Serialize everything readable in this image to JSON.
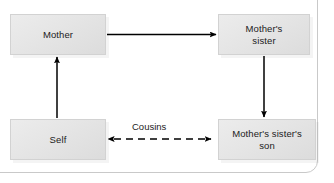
{
  "diagram": {
    "type": "kinship-relationship-diagram",
    "nodes": [
      {
        "id": "mother",
        "label": "Mother"
      },
      {
        "id": "mothers-sister",
        "label": "Mother's\nsister",
        "line1": "Mother's",
        "line2": "sister"
      },
      {
        "id": "self",
        "label": "Self"
      },
      {
        "id": "mothers-sisters-son",
        "label": "Mother's sister's\nson",
        "line1": "Mother's sister's",
        "line2": "son"
      }
    ],
    "edges": [
      {
        "id": "mother-to-sister",
        "from": "mother",
        "to": "mothers-sister",
        "style": "solid",
        "arrow": "single",
        "direction": "right",
        "label": ""
      },
      {
        "id": "sister-to-son",
        "from": "mothers-sister",
        "to": "mothers-sisters-son",
        "style": "solid",
        "arrow": "single",
        "direction": "down",
        "label": ""
      },
      {
        "id": "self-to-mother",
        "from": "self",
        "to": "mother",
        "style": "solid",
        "arrow": "single",
        "direction": "up",
        "label": ""
      },
      {
        "id": "self-to-son",
        "from": "self",
        "to": "mothers-sisters-son",
        "style": "dashed",
        "arrow": "double",
        "direction": "horizontal",
        "label": "Cousins"
      }
    ],
    "labels": {
      "cousins": "Cousins"
    },
    "colors": {
      "node_fill_light": "#ececec",
      "node_fill_dark": "#dcdcdc",
      "node_border": "#d2d2d2",
      "line": "#000000",
      "text": "#1b1b1b",
      "frame": "#c9c9c9",
      "background": "#ffffff"
    }
  }
}
